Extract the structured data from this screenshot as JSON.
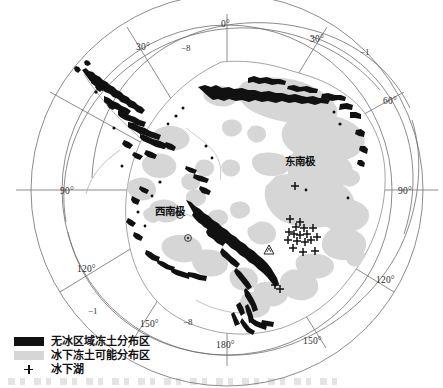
{
  "figure": {
    "type": "polar-stereographic-map"
  },
  "map": {
    "center": {
      "x": 227,
      "y": 190
    },
    "colors": {
      "ice_free_permafrost": "#111111",
      "subglacial_permafrost_possible": "#d6d6d6",
      "coastline": "#8a8a8a",
      "graticule": "#6e6e6e",
      "contour": "#6e6e6e",
      "background": "#ffffff"
    },
    "graticule_labels": [
      {
        "text": "0°",
        "x": 221,
        "y": 20
      },
      {
        "text": "30°",
        "x": 136,
        "y": 43
      },
      {
        "text": "30°",
        "x": 310,
        "y": 35
      },
      {
        "text": "60°",
        "x": 383,
        "y": 97
      },
      {
        "text": "90°",
        "x": 60,
        "y": 187
      },
      {
        "text": "90°",
        "x": 398,
        "y": 187
      },
      {
        "text": "120°",
        "x": 77,
        "y": 265
      },
      {
        "text": "120°",
        "x": 376,
        "y": 276
      },
      {
        "text": "150°",
        "x": 140,
        "y": 320
      },
      {
        "text": "150°",
        "x": 303,
        "y": 337
      },
      {
        "text": "180°",
        "x": 216,
        "y": 341
      }
    ],
    "contour_labels": [
      {
        "text": "−8",
        "x": 181,
        "y": 44
      },
      {
        "text": "−1",
        "x": 360,
        "y": 48
      },
      {
        "text": "−1",
        "x": 88,
        "y": 307
      },
      {
        "text": "−8",
        "x": 183,
        "y": 318
      }
    ],
    "region_labels": [
      {
        "text": "东南极",
        "x": 285,
        "y": 156
      },
      {
        "text": "西南极",
        "x": 155,
        "y": 206
      }
    ],
    "subglacial_lakes": [
      {
        "x": 295,
        "y": 186
      },
      {
        "x": 290,
        "y": 219
      },
      {
        "x": 300,
        "y": 222
      },
      {
        "x": 296,
        "y": 227
      },
      {
        "x": 304,
        "y": 228
      },
      {
        "x": 289,
        "y": 232
      },
      {
        "x": 294,
        "y": 234
      },
      {
        "x": 300,
        "y": 235
      },
      {
        "x": 307,
        "y": 234
      },
      {
        "x": 313,
        "y": 228
      },
      {
        "x": 317,
        "y": 237
      },
      {
        "x": 288,
        "y": 240
      },
      {
        "x": 297,
        "y": 241
      },
      {
        "x": 305,
        "y": 242
      },
      {
        "x": 311,
        "y": 240
      },
      {
        "x": 293,
        "y": 248
      },
      {
        "x": 303,
        "y": 252
      },
      {
        "x": 315,
        "y": 251
      },
      {
        "x": 275,
        "y": 285
      },
      {
        "x": 280,
        "y": 289
      }
    ],
    "station_markers": [
      {
        "symbol": "circled-dot",
        "x": 180,
        "y": 215
      },
      {
        "symbol": "circled-dot",
        "x": 188,
        "y": 238
      },
      {
        "symbol": "triangle",
        "x": 269,
        "y": 250
      }
    ]
  },
  "legend": {
    "items": [
      {
        "swatch": "dark",
        "label": "无冰区域冻土分布区"
      },
      {
        "swatch": "gray",
        "label": "冰下冻土可能分布区"
      },
      {
        "swatch": "plus",
        "label": "冰下湖"
      }
    ]
  }
}
